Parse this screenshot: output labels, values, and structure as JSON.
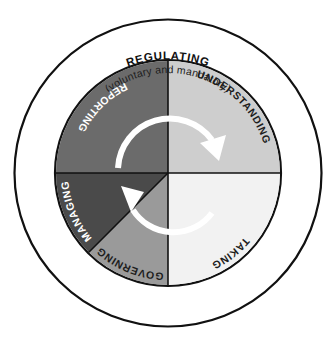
{
  "diagram": {
    "title": "REGULATING",
    "subtitle": "(voluntary and mandatory)",
    "type": "cycle-wheel",
    "center": {
      "x": 168,
      "y": 173
    },
    "radii": {
      "pie": 112,
      "outer_ring": 154
    },
    "background_color": "#ffffff",
    "outline_color": "#111111",
    "segments": [
      {
        "id": "reporting",
        "label": "REPORTING",
        "quadrant": "upper-left",
        "fill": "#6b6b6b",
        "text_color": "#ffffff",
        "start_angle": 270,
        "end_angle": 360
      },
      {
        "id": "understanding",
        "label": "UNDERSTANDING",
        "quadrant": "upper-right",
        "fill": "#cecece",
        "text_color": "#1d1d1d",
        "start_angle": 0,
        "end_angle": 90
      },
      {
        "id": "taking",
        "label": "TAKING",
        "quadrant": "lower-right",
        "fill": "#f2f2f2",
        "text_color": "#1d1d1d",
        "start_angle": 90,
        "end_angle": 180
      },
      {
        "id": "governing",
        "label": "GOVERNING",
        "quadrant": "lower-left-outer",
        "fill": "#9a9a9a",
        "text_color": "#1d1d1d",
        "start_angle": 180,
        "end_angle": 225
      },
      {
        "id": "managing",
        "label": "MANAGING",
        "quadrant": "lower-left-inner",
        "fill": "#4a4a4a",
        "text_color": "#ffffff",
        "start_angle": 225,
        "end_angle": 270
      }
    ],
    "flow_arrows": [
      {
        "id": "top-arrow",
        "direction": "clockwise",
        "from_segment": "reporting",
        "to_segment": "understanding",
        "color": "#ffffff"
      },
      {
        "id": "bottom-arrow",
        "direction": "clockwise",
        "from_segment": "taking",
        "to_segment": "managing",
        "color": "#ffffff"
      }
    ]
  }
}
